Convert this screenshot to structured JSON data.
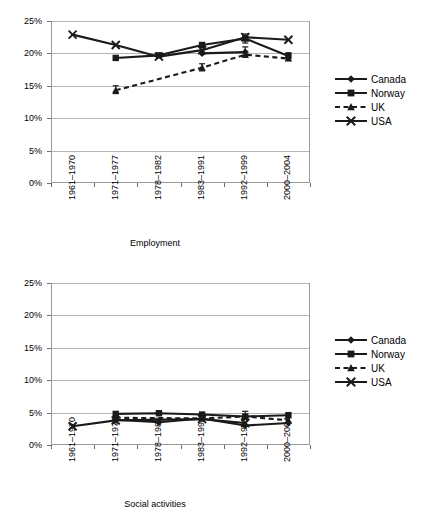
{
  "chart_data": [
    {
      "type": "line",
      "title": "",
      "xlabel": "Employment",
      "ylabel": "",
      "categories": [
        "1961–1970",
        "1971–1977",
        "1978–1982",
        "1983–1991",
        "1992–1999",
        "2000–2004"
      ],
      "ytick_labels": [
        "0%",
        "5%",
        "10%",
        "15%",
        "20%",
        "25%"
      ],
      "ytick_values": [
        0,
        5,
        10,
        15,
        20,
        25
      ],
      "ylim": [
        0,
        25
      ],
      "grid": true,
      "legend_position": "right",
      "series": [
        {
          "name": "Canada",
          "marker": "diamond",
          "dash": false,
          "values": [
            null,
            null,
            null,
            20.0,
            20.2,
            null
          ]
        },
        {
          "name": "Norway",
          "marker": "square",
          "dash": false,
          "values": [
            null,
            19.3,
            19.7,
            21.3,
            22.3,
            19.6
          ]
        },
        {
          "name": "UK",
          "marker": "triangle",
          "dash": true,
          "values": [
            null,
            14.3,
            null,
            17.8,
            19.8,
            19.2
          ]
        },
        {
          "name": "USA",
          "marker": "cross",
          "dash": false,
          "values": [
            22.9,
            21.3,
            19.5,
            20.5,
            22.5,
            22.1
          ]
        }
      ],
      "error_bars": [
        {
          "series": "Norway",
          "category": "1992–1999",
          "value": 22.3,
          "low": 21.6,
          "high": 23.0
        },
        {
          "series": "Canada",
          "category": "1992–1999",
          "value": 20.2,
          "low": 19.4,
          "high": 21.0
        },
        {
          "series": "UK",
          "category": "1971–1977",
          "value": 14.3,
          "low": 13.8,
          "high": 15.0
        },
        {
          "series": "UK",
          "category": "1983–1991",
          "value": 17.8,
          "low": 17.3,
          "high": 18.4
        },
        {
          "series": "Norway",
          "category": "2000–2004",
          "value": 19.6,
          "low": 18.9,
          "high": 20.1
        }
      ]
    },
    {
      "type": "line",
      "title": "",
      "xlabel": "Social activities",
      "ylabel": "",
      "categories": [
        "1961–1970",
        "1971–1977",
        "1978–1982",
        "1983–1991",
        "1992–1999",
        "2000–2004"
      ],
      "ytick_labels": [
        "0%",
        "5%",
        "10%",
        "15%",
        "20%",
        "25%"
      ],
      "ytick_values": [
        0,
        5,
        10,
        15,
        20,
        25
      ],
      "ylim": [
        0,
        25
      ],
      "grid": true,
      "legend_position": "right",
      "series": [
        {
          "name": "Canada",
          "marker": "diamond",
          "dash": false,
          "values": [
            null,
            3.9,
            3.5,
            4.1,
            3.0,
            3.4
          ]
        },
        {
          "name": "Norway",
          "marker": "square",
          "dash": false,
          "values": [
            null,
            4.8,
            4.9,
            4.7,
            4.4,
            4.6
          ]
        },
        {
          "name": "UK",
          "marker": "triangle",
          "dash": true,
          "values": [
            null,
            4.2,
            null,
            4.1,
            4.4,
            3.8
          ]
        },
        {
          "name": "USA",
          "marker": "cross",
          "dash": false,
          "values": [
            2.9,
            3.8,
            null,
            4.0,
            3.4,
            null
          ]
        }
      ],
      "error_bars": [
        {
          "series": "Norway",
          "category": "1992–1999",
          "value": 4.4,
          "low": 4.0,
          "high": 5.2
        },
        {
          "series": "Canada",
          "category": "1971–1977",
          "value": 3.9,
          "low": 3.4,
          "high": 4.5
        }
      ]
    }
  ],
  "charts": [
    {
      "id": "employment-chart",
      "axis_title": "Employment",
      "ytick_labels": [
        "25%",
        "20%",
        "15%",
        "10%",
        "5%",
        "0%"
      ],
      "xtick_labels": [
        "1961–1970",
        "1971–1977",
        "1978–1982",
        "1983–1991",
        "1992–1999",
        "2000–2004"
      ],
      "legend": [
        {
          "label": "Canada",
          "marker": "diamond",
          "dash": false
        },
        {
          "label": "Norway",
          "marker": "square",
          "dash": false
        },
        {
          "label": "UK",
          "marker": "triangle",
          "dash": true
        },
        {
          "label": "USA",
          "marker": "cross",
          "dash": false
        }
      ]
    },
    {
      "id": "social-activities-chart",
      "axis_title": "Social activities",
      "ytick_labels": [
        "25%",
        "20%",
        "15%",
        "10%",
        "5%",
        "0%"
      ],
      "xtick_labels": [
        "1961–1970",
        "1971–1977",
        "1978–1982",
        "1983–1991",
        "1992–1999",
        "2000–2004"
      ],
      "legend": [
        {
          "label": "Canada",
          "marker": "diamond",
          "dash": false
        },
        {
          "label": "Norway",
          "marker": "square",
          "dash": false
        },
        {
          "label": "UK",
          "marker": "triangle",
          "dash": true
        },
        {
          "label": "USA",
          "marker": "cross",
          "dash": false
        }
      ]
    }
  ],
  "colors": {
    "series": "#1a1a1a",
    "grid": "#b5b5b5",
    "frame": "#9a9a9a",
    "text": "#000000",
    "background": "#ffffff"
  }
}
